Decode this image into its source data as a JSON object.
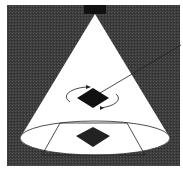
{
  "diagram": {
    "colors": {
      "background": "#3a3a3a",
      "cone": "#ffffff",
      "fixture": "#111111",
      "object": "#111111",
      "lines": "#222222",
      "frame": "#ffffff"
    },
    "elements": [
      {
        "name": "light-fixture"
      },
      {
        "name": "light-cone"
      },
      {
        "name": "rotating-object"
      },
      {
        "name": "rotation-arrows"
      },
      {
        "name": "pointer-line"
      },
      {
        "name": "floor-ellipse"
      },
      {
        "name": "floor-trapezoid"
      },
      {
        "name": "floor-projection"
      }
    ]
  }
}
